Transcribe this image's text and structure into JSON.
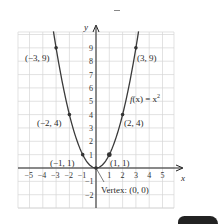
{
  "chart_data": {
    "type": "line",
    "title": "",
    "function_label": "f(x) = x²",
    "xlabel": "x",
    "ylabel": "y",
    "xlim": [
      -5.8,
      5.8
    ],
    "ylim": [
      -3,
      10.2
    ],
    "grid": true,
    "x_ticks": [
      -5,
      -4,
      -3,
      -2,
      -1,
      1,
      2,
      3,
      4,
      5
    ],
    "y_ticks": [
      -2,
      -1,
      1,
      2,
      3,
      4,
      5,
      6,
      7,
      8,
      9
    ],
    "series": [
      {
        "name": "f(x) = x^2",
        "x": [
          -3.2,
          -3,
          -2,
          -1,
          0,
          1,
          2,
          3,
          3.2
        ],
        "y": [
          10.24,
          9,
          4,
          1,
          0,
          1,
          4,
          9,
          10.24
        ]
      }
    ],
    "points": [
      {
        "x": -3,
        "y": 9,
        "label": "(−3, 9)"
      },
      {
        "x": -2,
        "y": 4,
        "label": "(−2, 4)"
      },
      {
        "x": -1,
        "y": 1,
        "label": "(−1, 1)"
      },
      {
        "x": 0,
        "y": 0,
        "label": "Vertex: (0, 0)"
      },
      {
        "x": 1,
        "y": 1,
        "label": "(1, 1)"
      },
      {
        "x": 2,
        "y": 4,
        "label": "(2, 4)"
      },
      {
        "x": 3,
        "y": 9,
        "label": "(3, 9)"
      }
    ],
    "annotations": [
      "f(x) = x²",
      "Vertex: (0, 0)"
    ]
  },
  "labels": {
    "p_m3": "(−3, 9)",
    "p_m2": "(−2, 4)",
    "p_m1": "(−1, 1)",
    "p_1": "(1, 1)",
    "p_2": "(2, 4)",
    "p_3": "(3, 9)",
    "vertex": "Vertex: (0, 0)",
    "func_f": "f",
    "func_rest": "(x) = x",
    "func_exp": "2",
    "x_axis": "x",
    "y_axis": "y"
  },
  "ticks": {
    "x": [
      "−5",
      "−4",
      "−3",
      "−2",
      "−1",
      "1",
      "2",
      "3",
      "4",
      "5"
    ],
    "y": [
      "9",
      "8",
      "7",
      "6",
      "5",
      "4",
      "3",
      "2",
      "1",
      "−1",
      "−2"
    ]
  }
}
